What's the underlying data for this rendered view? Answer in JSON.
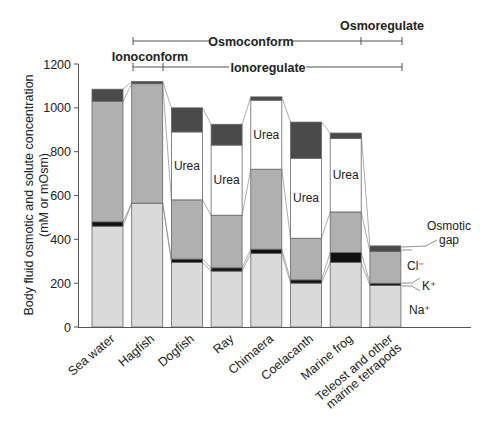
{
  "chart_data": {
    "type": "bar",
    "subtype": "stacked",
    "title": "",
    "xlabel": "",
    "ylabel": "Body fluid osmotic and solute concentration",
    "ylabel_line2": "(mM or mOsm)",
    "ylim": [
      0,
      1200
    ],
    "yticks": [
      0,
      200,
      400,
      600,
      800,
      1000,
      1200
    ],
    "grid": false,
    "categories": [
      "Sea water",
      "Hagfish",
      "Dogfish",
      "Ray",
      "Chimaera",
      "Coelacanth",
      "Marine frog",
      "Teleost and other\nmarine tetrapods"
    ],
    "series": [
      {
        "name": "Na+",
        "color": "#dadada",
        "values": [
          460,
          565,
          295,
          255,
          335,
          200,
          295,
          190
        ]
      },
      {
        "name": "K+",
        "color": "#111111",
        "values": [
          20,
          0,
          15,
          15,
          20,
          15,
          45,
          10
        ]
      },
      {
        "name": "Cl-",
        "color": "#b0b0b0",
        "values": [
          550,
          545,
          270,
          240,
          365,
          190,
          185,
          145
        ]
      },
      {
        "name": "Urea",
        "color": "#ffffff",
        "values": [
          0,
          0,
          310,
          320,
          315,
          365,
          335,
          0
        ]
      },
      {
        "name": "Osmotic gap",
        "color": "#4a4a4a",
        "values": [
          55,
          10,
          110,
          95,
          15,
          165,
          25,
          25
        ]
      }
    ],
    "totals": [
      1085,
      1120,
      1000,
      925,
      1050,
      935,
      885,
      370
    ],
    "urea_label": "Urea",
    "legend": {
      "position": "right-inline",
      "entries": [
        "Osmotic gap",
        "Cl⁻",
        "K⁺",
        "Na⁺"
      ]
    },
    "brackets": [
      {
        "label": "Osmoconform",
        "from": "Hagfish",
        "to": "Marine frog",
        "row": 1
      },
      {
        "label": "Osmoregulate",
        "from": "Marine frog",
        "to": "Teleost and other marine tetrapods",
        "row": 1
      },
      {
        "label": "Ionoconform",
        "from": "Hagfish",
        "to": "Hagfish",
        "row": 2
      },
      {
        "label": "Ionoregulate",
        "from": "Dogfish",
        "to": "Teleost and other marine tetrapods",
        "row": 2
      }
    ]
  },
  "labels": {
    "osmoconform": "Osmoconform",
    "osmoregulate": "Osmoregulate",
    "ionoconform": "Ionoconform",
    "ionoregulate": "Ionoregulate",
    "legend_gap_1": "Osmotic",
    "legend_gap_2": "gap",
    "legend_cl": "Cl⁻",
    "legend_k": "K⁺",
    "legend_na": "Na⁺"
  }
}
